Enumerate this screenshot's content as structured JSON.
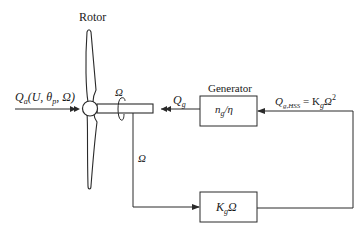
{
  "diagram": {
    "rotor": {
      "label": "Rotor"
    },
    "aero_input": {
      "symbol": "Q",
      "subscript": "a",
      "args": "(U, θ",
      "args_sub": "p",
      "args_end": ", Ω)"
    },
    "shaft_speed_label": "Ω",
    "generator_torque": {
      "symbol": "Q",
      "subscript": "g"
    },
    "generator": {
      "title": "Generator",
      "formula_n": "n",
      "formula_n_sub": "g",
      "formula_rest": "/η"
    },
    "hss_torque": {
      "symbol": "Q",
      "subscript": "g,HSS",
      "equals": " = K",
      "k_sub": "g",
      "omega": "Ω",
      "power": "2"
    },
    "feedback_speed_label": "Ω",
    "controller": {
      "k": "K",
      "k_sub": "g",
      "omega": "Ω"
    },
    "colors": {
      "stroke": "#2a2a2a",
      "background": "#ffffff"
    }
  }
}
